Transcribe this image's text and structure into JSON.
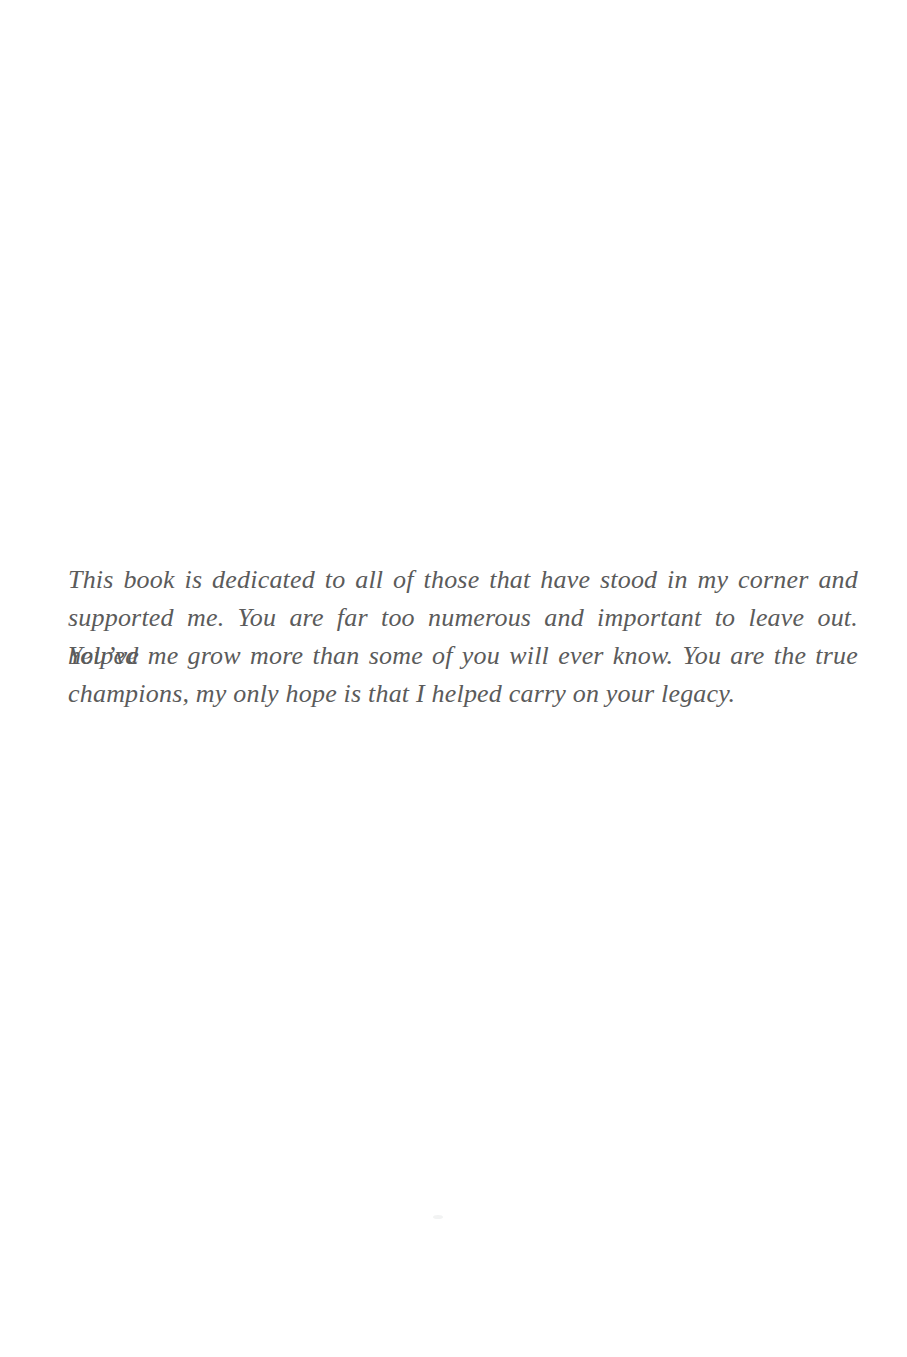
{
  "page": {
    "type": "book-dedication-page",
    "background_color": "#ffffff",
    "text_color": "#5b5b5b",
    "dedication_full_text": "This book is dedicated to all of those that have stood in my corner and supported me. You are far too numerous and important to leave out. You’ve helped me grow more than some of you will ever know. You are the true champions, my only hope is that I helped carry on your legacy.",
    "lines": [
      "This book is dedicated to all of those that have stood in my corner and",
      "supported me. You are far too numerous and important to leave out. You’ve",
      "helped me grow more than some of you will ever know. You are the true",
      "champions, my only hope is that I helped carry on your legacy."
    ]
  }
}
